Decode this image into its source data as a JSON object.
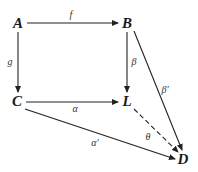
{
  "diagram": {
    "type": "commutative-diagram",
    "nodes": {
      "A": {
        "label": "A",
        "x": 18,
        "y": 23
      },
      "B": {
        "label": "B",
        "x": 127,
        "y": 23
      },
      "C": {
        "label": "C",
        "x": 17,
        "y": 101
      },
      "L": {
        "label": "L",
        "x": 127,
        "y": 101
      },
      "D": {
        "label": "D",
        "x": 183,
        "y": 159
      }
    },
    "edges": {
      "f": {
        "label": "f",
        "from": "A",
        "to": "B",
        "style": "solid"
      },
      "g": {
        "label": "g",
        "from": "A",
        "to": "C",
        "style": "solid"
      },
      "beta": {
        "label": "β",
        "from": "B",
        "to": "L",
        "style": "solid"
      },
      "beta_prime": {
        "label": "β′",
        "from": "B",
        "to": "D",
        "style": "solid"
      },
      "alpha": {
        "label": "α",
        "from": "C",
        "to": "L",
        "style": "solid"
      },
      "alpha_prime": {
        "label": "α′",
        "from": "C",
        "to": "D",
        "style": "solid"
      },
      "theta": {
        "label": "θ",
        "from": "L",
        "to": "D",
        "style": "dashed"
      }
    },
    "colors": {
      "line": "#222222",
      "text": "#1a1a1a",
      "label": "#333333",
      "background": "#ffffff"
    }
  }
}
